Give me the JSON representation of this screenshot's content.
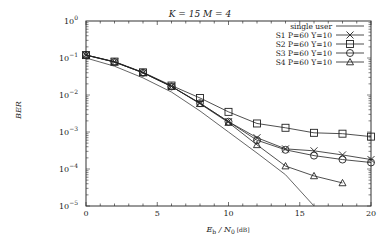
{
  "chart_data": {
    "type": "line",
    "title": "K = 15  M = 4",
    "xlabel": "E_b / N_0 [dB]",
    "ylabel": "BER",
    "xlim": [
      0,
      20
    ],
    "ylim": [
      1e-05,
      1
    ],
    "yscale": "log",
    "x_ticks": [
      0,
      5,
      10,
      15,
      20
    ],
    "y_ticks": [
      "10^0",
      "10^-1",
      "10^-2",
      "10^-3",
      "10^-4",
      "10^-5"
    ],
    "grid": false,
    "legend_position": "upper right",
    "series": [
      {
        "name": "single user",
        "marker": "none",
        "x": [
          0,
          2,
          4,
          6,
          8,
          10,
          12,
          14,
          16
        ],
        "values": [
          0.1,
          0.06,
          0.029,
          0.012,
          0.0037,
          0.001,
          0.00027,
          7e-05,
          1e-05
        ]
      },
      {
        "name": "S1 P=60 Y=10",
        "marker": "x",
        "x": [
          0,
          2,
          4,
          6,
          8,
          10,
          12,
          14,
          16,
          18,
          20
        ],
        "values": [
          0.12,
          0.078,
          0.04,
          0.017,
          0.006,
          0.0019,
          0.0007,
          0.00035,
          0.00031,
          0.00024,
          0.00018
        ]
      },
      {
        "name": "S2 P=60 Y=10",
        "marker": "square",
        "x": [
          0,
          2,
          4,
          6,
          8,
          10,
          12,
          14,
          16,
          18,
          20
        ],
        "values": [
          0.12,
          0.08,
          0.041,
          0.018,
          0.0083,
          0.0035,
          0.0017,
          0.0013,
          0.00095,
          0.0009,
          0.00075
        ]
      },
      {
        "name": "S3 P=60 Y=10",
        "marker": "circle",
        "x": [
          0,
          2,
          4,
          6,
          8,
          10,
          12,
          14,
          16,
          18,
          20
        ],
        "values": [
          0.12,
          0.078,
          0.04,
          0.017,
          0.006,
          0.0019,
          0.0006,
          0.00033,
          0.00023,
          0.00018,
          0.00015
        ]
      },
      {
        "name": "S4 P=60 Y=10",
        "marker": "triangle",
        "x": [
          0,
          2,
          4,
          6,
          8,
          10,
          12,
          14,
          16,
          18
        ],
        "values": [
          0.12,
          0.078,
          0.04,
          0.017,
          0.0058,
          0.0018,
          0.00045,
          0.00012,
          6.5e-05,
          4.2e-05
        ]
      }
    ]
  },
  "labels": {
    "title": "K = 15  M = 4",
    "ylabel": "BER",
    "xlabel_main": "E",
    "xlabel_sub1": "b",
    "xlabel_mid": " / N",
    "xlabel_sub2": "0",
    "xlabel_unit": " [dB]"
  }
}
